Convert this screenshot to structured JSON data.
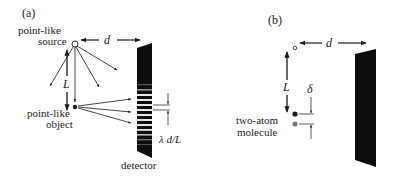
{
  "panel_a": {
    "label": "(a)",
    "source_label_line1": "point-like",
    "source_label_line2": "source",
    "distance_label": "d",
    "length_label": "L",
    "object_label_line1": "point-like",
    "object_label_line2": "object",
    "detector_label": "detector",
    "fringe_spacing_label": "λ d/L"
  },
  "panel_b": {
    "label": "(b)",
    "distance_label": "d",
    "length_label": "L",
    "separation_label": "δ",
    "molecule_label_line1": "two-atom",
    "molecule_label_line2": "molecule"
  },
  "colors": {
    "ink": "#1a1a1a",
    "detector": "#0d0d0d",
    "fringe_light": "#e8e8e8",
    "second_atom": "#7a7a7a"
  }
}
